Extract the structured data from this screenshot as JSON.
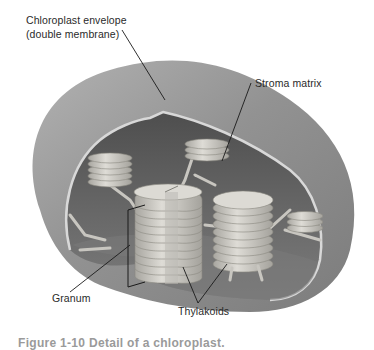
{
  "figure": {
    "labels": {
      "envelope_line1": "Chloroplast envelope",
      "envelope_line2": "(double membrane)",
      "stroma": "Stroma matrix",
      "granum": "Granum",
      "thylakoids": "Thylakoids"
    },
    "caption": "Figure 1-10  Detail of a chloroplast.",
    "colors": {
      "outer_shell": "#8f8f8f",
      "shell_highlight": "#b4b4b4",
      "inner_cavity": "#5a5a5a",
      "floor": "#7a7a7a",
      "membrane_rim": "#d8d8d8",
      "disc": "#d4d2cc",
      "disc_shadow": "#9c9a94",
      "leader_line": "#1a1a1a"
    }
  }
}
